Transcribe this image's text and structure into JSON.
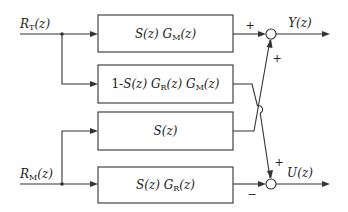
{
  "diagram": {
    "type": "block-diagram",
    "inputs": [
      {
        "id": "rt",
        "label": "R_T(z)",
        "display": "RT(z)"
      },
      {
        "id": "rm",
        "label": "R_M(z)",
        "display": "RM(z)"
      }
    ],
    "outputs": [
      {
        "id": "y",
        "label": "Y(z)"
      },
      {
        "id": "u",
        "label": "U(z)"
      }
    ],
    "blocks": [
      {
        "id": "b1",
        "label": "S(z) G_M(z)",
        "display": "S(z) GM(z)"
      },
      {
        "id": "b2",
        "label": "1-S(z) G_R(z) G_M(z)",
        "display": "1-S(z) GR(z) GM(z)"
      },
      {
        "id": "b3",
        "label": "S(z)",
        "display": "S(z)"
      },
      {
        "id": "b4",
        "label": "S(z) G_R(z)",
        "display": "S(z) GR(z)"
      }
    ],
    "summing_junctions": [
      {
        "id": "sum_y",
        "inputs": [
          {
            "from": "b1",
            "sign": "+"
          },
          {
            "from": "b3",
            "sign": "+"
          }
        ],
        "output": "y"
      },
      {
        "id": "sum_u",
        "inputs": [
          {
            "from": "b2",
            "sign": "+"
          },
          {
            "from": "b4",
            "sign": "−"
          }
        ],
        "output": "u"
      }
    ],
    "connections": [
      {
        "from": "rt",
        "to": "b1"
      },
      {
        "from": "rt",
        "to": "b2"
      },
      {
        "from": "rm",
        "to": "b3"
      },
      {
        "from": "rm",
        "to": "b4"
      },
      {
        "from": "b1",
        "to": "sum_y"
      },
      {
        "from": "b3",
        "to": "sum_y",
        "note": "crosses over b2 line"
      },
      {
        "from": "b2",
        "to": "sum_u"
      },
      {
        "from": "b4",
        "to": "sum_u"
      }
    ],
    "signs": {
      "y_top": "+",
      "y_side": "+",
      "u_side": "+",
      "u_bottom": "−"
    }
  }
}
